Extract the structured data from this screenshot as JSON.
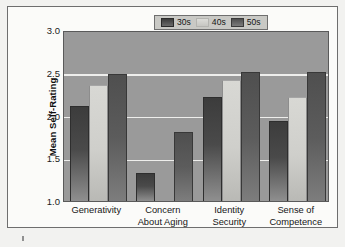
{
  "chart_data": {
    "type": "bar",
    "title": "",
    "xlabel": "",
    "ylabel": "Mean Self-Rating",
    "ylim": [
      1.0,
      3.0
    ],
    "yticks": [
      "1.0",
      "1.5",
      "2.0",
      "2.5",
      "3.0"
    ],
    "ytick_values": [
      1.0,
      1.5,
      2.0,
      2.5,
      3.0
    ],
    "grid": true,
    "legend_position": "top-right",
    "categories": [
      "Generativity",
      "Concern About Aging",
      "Identity Security",
      "Sense of Competence"
    ],
    "category_lines": [
      [
        "Generativity"
      ],
      [
        "Concern",
        "About Aging"
      ],
      [
        "Identity",
        "Security"
      ],
      [
        "Sense of",
        "Competence"
      ]
    ],
    "series": [
      {
        "name": "30s",
        "color": "#444444",
        "values": [
          2.1,
          1.32,
          2.21,
          1.92
        ]
      },
      {
        "name": "40s",
        "color": "#d4d4d0",
        "values": [
          2.35,
          1.0,
          2.4,
          2.21
        ]
      },
      {
        "name": "50s",
        "color": "#5c5c5c",
        "values": [
          2.47,
          1.8,
          2.5,
          2.5
        ]
      }
    ]
  },
  "legend": {
    "items": [
      {
        "label": "30s",
        "swatch": "series-30s-swatch"
      },
      {
        "label": "40s",
        "swatch": "series-40s-swatch"
      },
      {
        "label": "50s",
        "swatch": "series-50s-swatch"
      }
    ]
  },
  "colors": {
    "plot_background": "#9a9a9a",
    "gridline": "#eeeeec",
    "figure_background": "#fbfbf9",
    "frame_border": "#6e6e6e",
    "legend_background": "#c9c9c5"
  }
}
